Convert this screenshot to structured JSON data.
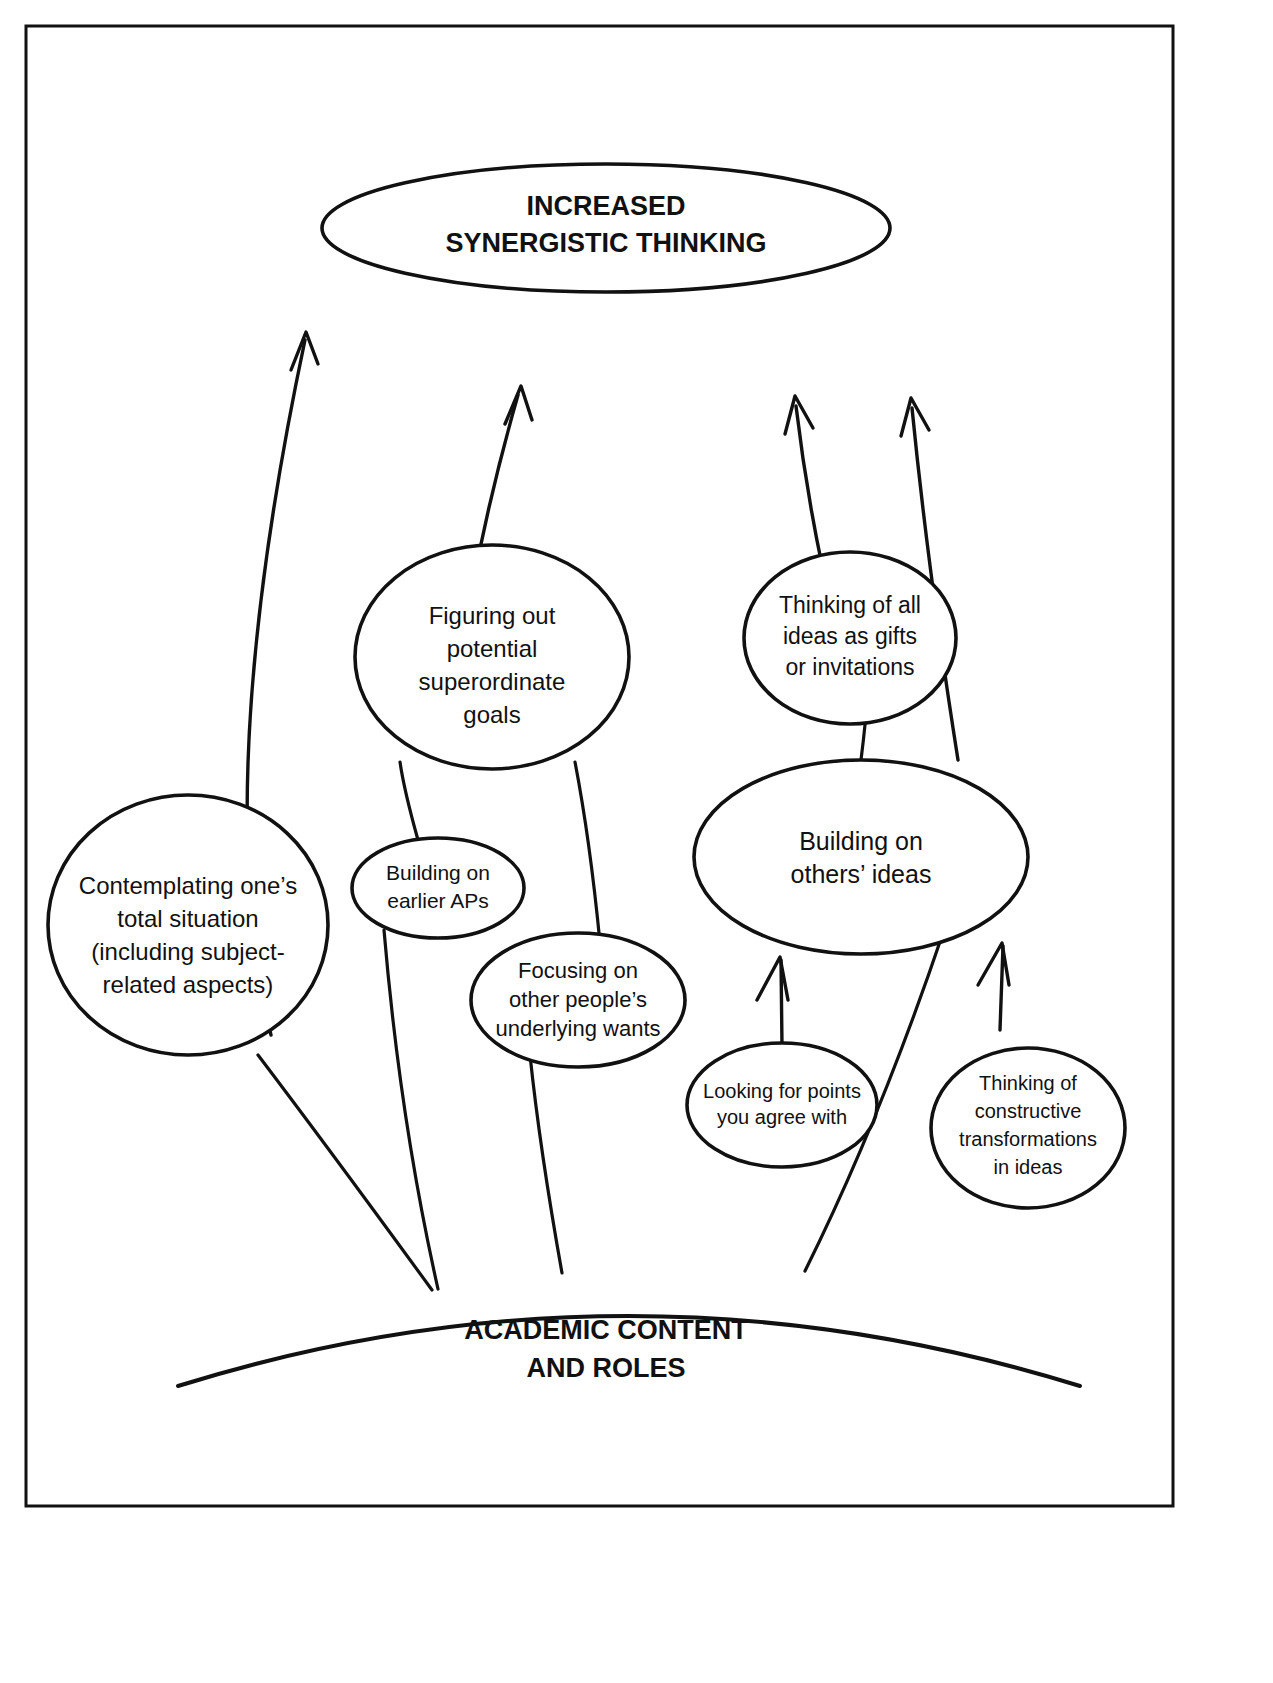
{
  "diagram": {
    "title": "Increased Synergistic Thinking",
    "type": "concept-map",
    "stroke_color": "#111111",
    "background_color": "#ffffff",
    "frame": {
      "label": "diagram-frame"
    },
    "goal_node": {
      "id": "increased-synergistic-thinking",
      "lines": [
        "INCREASED",
        "SYNERGISTIC THINKING"
      ],
      "style": "bold-uppercase-ellipse"
    },
    "base_node": {
      "id": "academic-content-and-roles",
      "lines": [
        "ACADEMIC CONTENT",
        "AND ROLES"
      ],
      "style": "bold-uppercase-arc"
    },
    "nodes": [
      {
        "id": "contemplating-total-situation",
        "lines": [
          "Contemplating one’s",
          "total situation",
          "(including subject-",
          "related aspects)"
        ]
      },
      {
        "id": "figuring-out-superordinate-goals",
        "lines": [
          "Figuring out",
          "potential",
          "superordinate",
          "goals"
        ]
      },
      {
        "id": "building-on-earlier-aps",
        "lines": [
          "Building on",
          "earlier APs"
        ]
      },
      {
        "id": "focusing-on-underlying-wants",
        "lines": [
          "Focusing on",
          "other people’s",
          "underlying wants"
        ]
      },
      {
        "id": "thinking-of-ideas-as-gifts",
        "lines": [
          "Thinking of all",
          "ideas as gifts",
          "or invitations"
        ]
      },
      {
        "id": "building-on-others-ideas",
        "lines": [
          "Building on",
          "others’ ideas"
        ]
      },
      {
        "id": "looking-for-points-you-agree-with",
        "lines": [
          "Looking for points",
          "you agree with"
        ]
      },
      {
        "id": "thinking-of-constructive-transformations",
        "lines": [
          "Thinking of",
          "constructive",
          "transformations",
          "in ideas"
        ]
      }
    ],
    "arrows": [
      {
        "id": "arrow-left-to-goal",
        "from": "contemplating-total-situation",
        "to": "increased-synergistic-thinking"
      },
      {
        "id": "arrow-superordinate-to-goal",
        "from": "figuring-out-superordinate-goals",
        "to": "increased-synergistic-thinking"
      },
      {
        "id": "arrow-gifts-to-goal",
        "from": "thinking-of-ideas-as-gifts",
        "to": "increased-synergistic-thinking"
      },
      {
        "id": "arrow-building-others-to-goal",
        "from": "building-on-others-ideas",
        "to": "increased-synergistic-thinking"
      },
      {
        "id": "arrow-agree-to-building-others",
        "from": "looking-for-points-you-agree-with",
        "to": "building-on-others-ideas"
      },
      {
        "id": "arrow-transformations-to-building-others",
        "from": "thinking-of-constructive-transformations",
        "to": "building-on-others-ideas"
      }
    ],
    "connectors": [
      {
        "id": "link-base-to-contemplating",
        "from": "academic-content-and-roles",
        "to": "contemplating-total-situation"
      },
      {
        "id": "link-base-to-building-earlier-aps",
        "from": "academic-content-and-roles",
        "to": "building-on-earlier-aps"
      },
      {
        "id": "link-base-to-focusing-wants",
        "from": "academic-content-and-roles",
        "to": "focusing-on-underlying-wants"
      },
      {
        "id": "link-base-to-building-others",
        "from": "academic-content-and-roles",
        "to": "building-on-others-ideas"
      },
      {
        "id": "link-earlier-aps-to-superordinate",
        "from": "building-on-earlier-aps",
        "to": "figuring-out-superordinate-goals"
      },
      {
        "id": "link-focusing-wants-to-superordinate",
        "from": "focusing-on-underlying-wants",
        "to": "figuring-out-superordinate-goals"
      },
      {
        "id": "link-building-others-to-gifts",
        "from": "building-on-others-ideas",
        "to": "thinking-of-ideas-as-gifts"
      }
    ]
  }
}
